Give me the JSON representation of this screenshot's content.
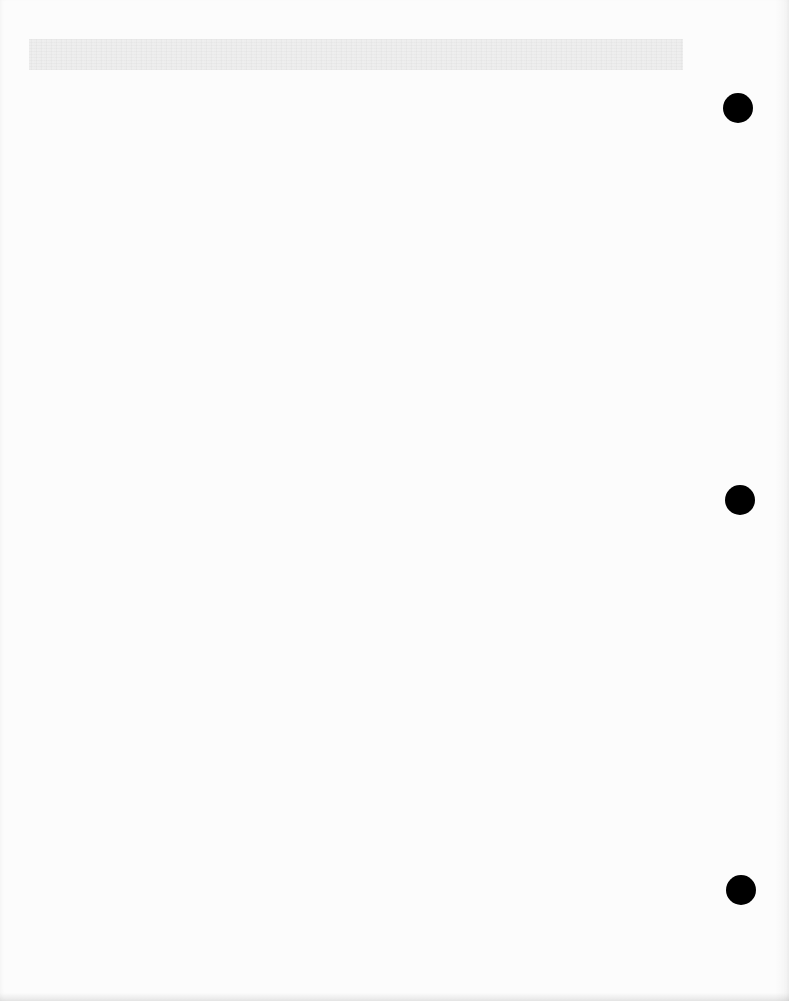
{
  "document": {
    "type": "blank scanned sheet",
    "text_content": "",
    "background_color": "#fcfcfc",
    "header_band": {
      "text": "",
      "color": "#f1f1f1"
    },
    "punch_holes": [
      {
        "id": "hole-top",
        "cx": 738,
        "cy": 108,
        "diameter": 30,
        "color": "#000000"
      },
      {
        "id": "hole-middle",
        "cx": 740,
        "cy": 500,
        "diameter": 30,
        "color": "#000000"
      },
      {
        "id": "hole-bottom",
        "cx": 741,
        "cy": 890,
        "diameter": 30,
        "color": "#000000"
      }
    ]
  }
}
